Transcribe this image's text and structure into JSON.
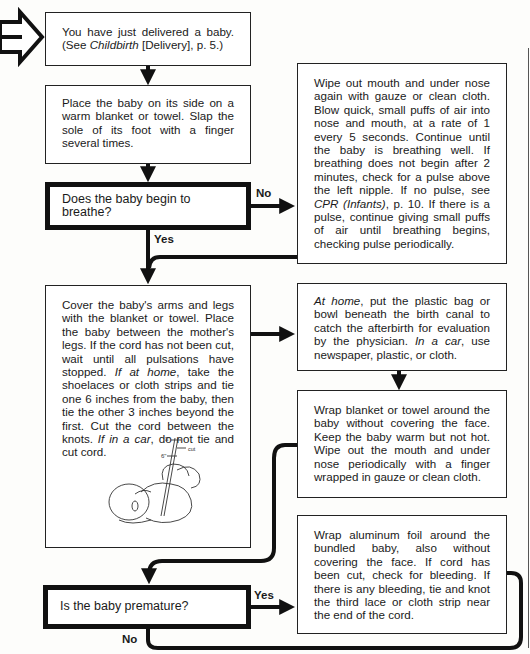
{
  "flowchart": {
    "start": {
      "text_before": "You have just delivered a baby. (See ",
      "ref_italic": "Childbirth",
      "text_after": " [Delivery], p.  5.)"
    },
    "step_place_baby": "Place the baby on its side on a warm blanket or towel. Slap the sole of its foot with a finger several times.",
    "decision_breathe": {
      "question": "Does the baby begin to breathe?",
      "no_label": "No",
      "yes_label": "Yes"
    },
    "step_wipe_mouth": {
      "text_before": "Wipe out mouth and under nose again with gauze or clean cloth. Blow quick, small puffs of air into nose and mouth, at a rate of 1 every 5 seconds. Continue until the baby is breathing well. If breathing does not begin after 2 minutes, check for a pulse above the left nipple. If no pulse, see ",
      "ref_italic": "CPR (Infants)",
      "text_after": ", p. 10. If there is a pulse, continue giving small puffs of air until breathing begins, checking pulse periodically."
    },
    "step_cover_baby": {
      "part1": "Cover the baby's arms and legs with the blanket or towel. Place the baby between the mother's legs. If the cord has not been cut, wait until all pulsations have stopped. ",
      "italic1": "If at home",
      "part2": ", take the shoelaces or cloth strips and tie one 6 inches from the baby, then tie the other 3 inches beyond the first. Cut the cord between the knots. ",
      "italic2": "If in a car",
      "part3": ", do not tie and cut cord.",
      "illustration": {
        "label_3in": "3\"",
        "label_6in": "6\"",
        "label_cut": "cut"
      }
    },
    "step_afterbirth": {
      "italic1": "At home",
      "part1": ", put the plastic bag or bowl beneath the birth canal to catch the afterbirth for evaluation by the physician. ",
      "italic2": "In a car",
      "part2": ", use newspaper, plastic, or cloth."
    },
    "step_wrap_blanket": "Wrap blanket or towel around the baby without covering the face. Keep the baby warm but not hot. Wipe out the mouth and under nose periodically with a finger wrapped in gauze or clean cloth.",
    "step_wrap_foil": "Wrap aluminum foil around the bundled baby, also without covering the face. If cord has been cut, check for bleeding. If there is any bleeding, tie and knot the third lace or cloth strip near the end of the cord.",
    "decision_premature": {
      "question": "Is the baby premature?",
      "yes_label": "Yes",
      "no_label": "No"
    }
  },
  "colors": {
    "line": "#111111",
    "box_border": "#222222",
    "background": "#fdfdfb"
  }
}
